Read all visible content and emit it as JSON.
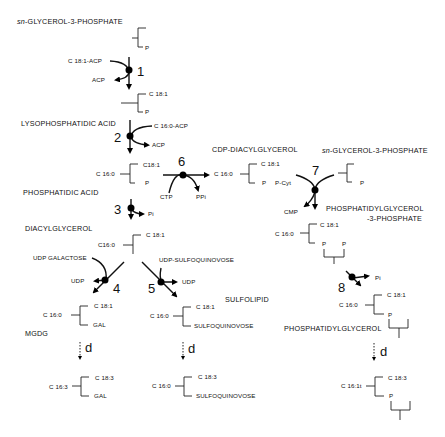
{
  "compounds": {
    "g3p_top": "sn-GLYCEROL-3-PHOSPHATE",
    "lpa": "LYSOPHOSPHATIDIC ACID",
    "pa": "PHOSPHATIDIC ACID",
    "dag": "DIACYLGLYCEROL",
    "cdp_dag": "CDP-DIACYLGLYCEROL",
    "g3p_right": "sn-GLYCEROL-3-PHOSPHATE",
    "pgp_line1": "PHOSPHATIDYLGLYCEROL",
    "pgp_line2": "-3-PHOSPHATE",
    "pg": "PHOSPHATIDYLGLYCEROL",
    "mgdg": "MGDG",
    "sulfolipid": "SULFOLIPID"
  },
  "substrates": {
    "c181_acp": "C 18:1-ACP",
    "acp1": "ACP",
    "c160_acp": "C 16:0-ACP",
    "acp2": "ACP",
    "pi3": "Pi",
    "ctp": "CTP",
    "ppi": "PPi",
    "pcyt": "P-Cyt",
    "cmp": "CMP",
    "udp_gal": "UDP GALACTOSE",
    "udp4": "UDP",
    "udp_sq": "UDP-SULFOQUINOVOSE",
    "udp5": "UDP",
    "pi8": "Pi"
  },
  "steps": [
    "1",
    "2",
    "3",
    "4",
    "5",
    "6",
    "7",
    "8"
  ],
  "desaturation_label": "d",
  "molecules": {
    "g3p": {
      "p": "P"
    },
    "lpa": {
      "top": "C 18:1",
      "bottom": "P"
    },
    "pa": {
      "left": "C 16:0",
      "top": "C18:1",
      "bottom": "P"
    },
    "dag": {
      "left": "C16:0",
      "top": "C 18:1"
    },
    "cdp": {
      "left": "C 16:0",
      "top": "C 18:1",
      "bottom": "P"
    },
    "g3p_right": {
      "p": "P"
    },
    "pgp": {
      "left": "C 16:0",
      "top": "C 18:1",
      "p1": "P",
      "p2": "P"
    },
    "mgdg": {
      "left": "C 16:0",
      "top": "C 18:1",
      "bottom": "GAL"
    },
    "sl": {
      "left": "C 16:0",
      "top": "C 18:1",
      "bottom": "SULFOQUINOVOSE"
    },
    "pg": {
      "left": "C 16:0",
      "top": "C 18:1",
      "bottom": "P"
    },
    "mgdg_d": {
      "left": "C 16:3",
      "top": "C 18:3",
      "bottom": "GAL"
    },
    "sl_d": {
      "left": "C 16:0",
      "top": "C 18:3",
      "bottom": "SULFOQUINOVOSE"
    },
    "pg_d": {
      "left": "C 16:1t",
      "top": "C 18:3",
      "bottom": "P"
    }
  }
}
